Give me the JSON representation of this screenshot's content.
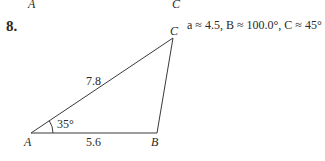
{
  "prev_problem": {
    "label_A": "A",
    "label_C": "C"
  },
  "problem": {
    "number": "8.",
    "answer": "a ≈ 4.5, B ≈ 100.0°, C ≈ 45°"
  },
  "triangle": {
    "vertices": {
      "A": "A",
      "B": "B",
      "C": "C"
    },
    "side_AC": "7.8",
    "side_AB": "5.6",
    "angle_A": "35°"
  },
  "colors": {
    "line": "#3a3a3a",
    "text": "#2a2a2a"
  }
}
